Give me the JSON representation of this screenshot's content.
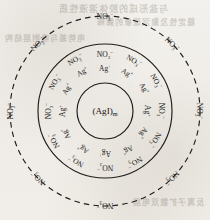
{
  "figure": {
    "name": "silver-iodide-micelle-diagram",
    "background_color": "#f1eee9",
    "ink_color": "#1d1b19",
    "core": {
      "formula_open": "(AgI)",
      "formula_sub": "m",
      "full_text": "(AgI)m"
    },
    "ion_adsorbed": {
      "symbol": "Ag",
      "charge": "+",
      "full_text": "Ag+",
      "count": 12
    },
    "ion_counter": {
      "symbol": "NO",
      "sub": "3",
      "charge": "−",
      "full_text": "NO3−",
      "inner_layer_count": 12,
      "diffuse_layer_count": 8
    },
    "boundaries": {
      "core_circle": {
        "style": "solid",
        "radius": 28
      },
      "stern_circle": {
        "style": "solid",
        "radius": 67
      },
      "diffuse_circle": {
        "style": "dashed",
        "radius": 95
      }
    },
    "center": {
      "cx": 105,
      "cy": 111
    },
    "rings": {
      "adsorbed_radius": 44,
      "counter_inner_radius": 58,
      "counter_outer_radius": 95
    }
  },
  "bleed_through": {
    "visible": true,
    "lines": [
      "与盐形成的胶体溶液性质",
      "稳定性及聚沉现象的解释",
      "电势差与吸附层结构",
      "反离子扩散双电层"
    ]
  }
}
